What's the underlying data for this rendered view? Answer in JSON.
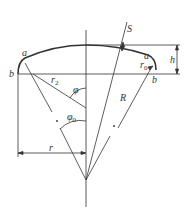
{
  "diagram": {
    "type": "dished head geometry (torispherical)",
    "colors": {
      "line": "#333333",
      "background": "#ffffff"
    },
    "labels": {
      "S": "S",
      "a_left": "a",
      "a_right": "a",
      "b_left": "b",
      "b_right": "b",
      "h": "h",
      "r2": "r",
      "r2_sub": "2",
      "r0": "r",
      "r0_sub": "0",
      "phi": "φ",
      "phi0": "φ",
      "phi0_sub": "0",
      "R": "R",
      "r": "r"
    }
  }
}
